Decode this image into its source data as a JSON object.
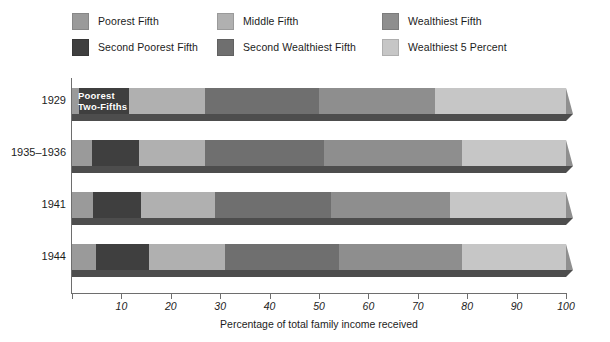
{
  "legend": {
    "items": [
      {
        "label": "Poorest Fifth",
        "color": "#9a9a9a",
        "key": "poorest_fifth"
      },
      {
        "label": "Middle Fifth",
        "color": "#b0b0b0",
        "key": "middle_fifth"
      },
      {
        "label": "Wealthiest Fifth",
        "color": "#8e8e8e",
        "key": "wealthiest_fifth"
      },
      {
        "label": "Second Poorest Fifth",
        "color": "#3f3f3f",
        "key": "second_poorest_fifth"
      },
      {
        "label": "Second Wealthiest Fifth",
        "color": "#6f6f6f",
        "key": "second_wealthiest_fifth"
      },
      {
        "label": "Wealthiest 5 Percent",
        "color": "#c6c6c6",
        "key": "wealthiest_5_percent"
      }
    ]
  },
  "annotations": {
    "poorest_two_fifths": "Poorest\nTwo-Fifths",
    "poorest_two_fifths_line1": "Poorest",
    "poorest_two_fifths_line2": "Two-Fifths"
  },
  "chart_data": {
    "type": "bar",
    "orientation": "horizontal",
    "stacked": true,
    "title": "",
    "xlabel": "Percentage of total family income received",
    "ylabel": "",
    "xlim": [
      0,
      100
    ],
    "xticks": [
      0,
      10,
      20,
      30,
      40,
      50,
      60,
      70,
      80,
      90,
      100
    ],
    "xtick_labels": [
      "",
      "10",
      "20",
      "30",
      "40",
      "50",
      "60",
      "70",
      "80",
      "90",
      "100"
    ],
    "grid": false,
    "legend_position": "top",
    "categories": [
      "1929",
      "1935–1936",
      "1941",
      "1944"
    ],
    "series": [
      {
        "name": "Poorest Fifth",
        "values": [
          1.4,
          4.1,
          4.2,
          4.9
        ]
      },
      {
        "name": "Second Poorest Fifth",
        "values": [
          10.2,
          9.4,
          9.8,
          10.6
        ]
      },
      {
        "name": "Middle Fifth",
        "values": [
          15.4,
          13.5,
          15.0,
          15.5
        ]
      },
      {
        "name": "Second Wealthiest Fifth",
        "values": [
          23.0,
          24.0,
          23.5,
          23.0
        ]
      },
      {
        "name": "Wealthiest Fifth",
        "values": [
          50.0,
          49.0,
          47.5,
          46.0
        ]
      }
    ],
    "cumulative_boundaries": {
      "1929": [
        1.4,
        11.6,
        27.0,
        50.0,
        73.5,
        100
      ],
      "1935–1936": [
        4.1,
        13.5,
        27.0,
        51.0,
        79.0,
        100
      ],
      "1941": [
        4.2,
        14.0,
        29.0,
        52.5,
        76.5,
        100
      ],
      "1944": [
        4.9,
        15.5,
        31.0,
        54.0,
        79.0,
        100
      ]
    },
    "wealthiest_5_percent_start": {
      "1929": 73.5,
      "1935–1936": 79.0,
      "1941": 76.5,
      "1944": 79.0
    }
  }
}
